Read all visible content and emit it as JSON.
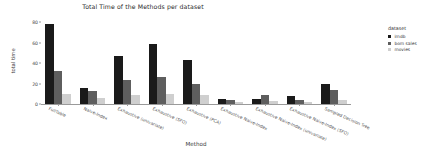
{
  "chart_data": {
    "type": "bar",
    "title": "Total Time of the Methods per dataset",
    "xlabel": "Method",
    "ylabel": "total time",
    "ylim": [
      0,
      84
    ],
    "yticks": [
      0,
      20,
      40,
      60,
      80
    ],
    "ytick_labels": [
      "0",
      "20",
      "40",
      "60",
      "80"
    ],
    "grid": false,
    "legend_title": "dataset",
    "legend_position": "right",
    "categories": [
      "FullTable",
      "Naive-Index",
      "Exhaustive (univariate)",
      "Exhaustive (SFO)",
      "Exhaustive (PCA)",
      "Exhaustive Naive-Index",
      "Exhaustive Naive-Index (univariate)",
      "Exhaustive Naive-Index (SFO)",
      "Sampled Decision Tree"
    ],
    "series": [
      {
        "name": "imdb",
        "color": "#1a1a1a",
        "values": [
          78,
          16,
          47,
          59,
          43,
          5,
          5,
          8,
          20
        ]
      },
      {
        "name": "bom sales",
        "color": "#5e5e5e",
        "values": [
          32,
          13,
          23,
          26,
          20,
          4,
          9,
          4,
          14
        ]
      },
      {
        "name": "movies",
        "color": "#cfcfcf",
        "values": [
          10,
          6,
          9,
          10,
          9,
          2,
          3,
          2,
          4
        ]
      }
    ]
  }
}
